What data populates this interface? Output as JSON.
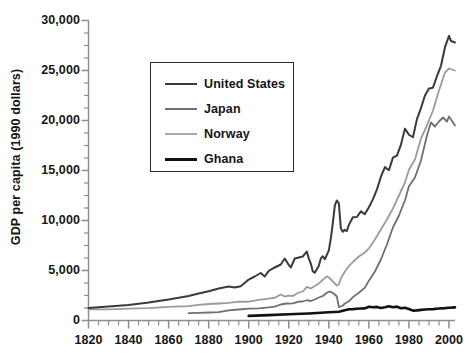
{
  "chart_data": {
    "type": "line",
    "title": "",
    "xlabel": "",
    "ylabel": "GDP per capita (1990 dollars)",
    "xlim": [
      1820,
      2003
    ],
    "ylim": [
      0,
      30000
    ],
    "grid": false,
    "legend_position": "upper-left-inside",
    "y_ticks": [
      0,
      5000,
      10000,
      15000,
      20000,
      25000,
      30000
    ],
    "y_tick_labels": [
      "0",
      "5,000",
      "10,000",
      "15,000",
      "20,000",
      "25,000",
      "30,000"
    ],
    "y_minor_step": 1250,
    "x_ticks": [
      1820,
      1840,
      1860,
      1880,
      1900,
      1920,
      1940,
      1960,
      1980,
      2000
    ],
    "x_tick_labels": [
      "1820",
      "1840",
      "1860",
      "1880",
      "1900",
      "1920",
      "1940",
      "1960",
      "1980",
      "2000"
    ],
    "x_minor_step": 5,
    "series": [
      {
        "name": "United States",
        "color": "#3a3a3a",
        "width": 2.0,
        "x": [
          1820,
          1830,
          1840,
          1850,
          1860,
          1870,
          1875,
          1880,
          1885,
          1890,
          1893,
          1896,
          1900,
          1903,
          1906,
          1908,
          1910,
          1913,
          1916,
          1918,
          1920,
          1921,
          1923,
          1925,
          1927,
          1929,
          1930,
          1931,
          1932,
          1933,
          1934,
          1935,
          1936,
          1937,
          1938,
          1939,
          1940,
          1941,
          1942,
          1943,
          1944,
          1945,
          1946,
          1947,
          1948,
          1949,
          1950,
          1952,
          1954,
          1956,
          1958,
          1960,
          1962,
          1964,
          1966,
          1968,
          1970,
          1972,
          1974,
          1976,
          1978,
          1980,
          1982,
          1984,
          1986,
          1988,
          1990,
          1992,
          1994,
          1996,
          1998,
          2000,
          2001,
          2003
        ],
        "y": [
          1257,
          1400,
          1560,
          1806,
          2102,
          2445,
          2700,
          2920,
          3200,
          3396,
          3300,
          3420,
          4091,
          4400,
          4750,
          4400,
          4964,
          5301,
          5600,
          6200,
          5552,
          5300,
          6200,
          6300,
          6400,
          6899,
          6213,
          5691,
          4908,
          4777,
          5114,
          5467,
          6204,
          6430,
          6126,
          6561,
          7010,
          8206,
          9741,
          11510,
          12000,
          11709,
          9197,
          8886,
          9065,
          8944,
          9561,
          10316,
          10350,
          10914,
          10640,
          11328,
          12110,
          13090,
          14379,
          15340,
          15030,
          16284,
          16491,
          17567,
          19188,
          18577,
          18325,
          20140,
          21236,
          22499,
          23201,
          23281,
          24427,
          25473,
          27331,
          28467,
          27948,
          27800
        ]
      },
      {
        "name": "Norway",
        "color": "#9b9b9b",
        "width": 1.8,
        "x": [
          1820,
          1830,
          1840,
          1850,
          1860,
          1870,
          1875,
          1880,
          1885,
          1890,
          1895,
          1900,
          1905,
          1910,
          1913,
          1916,
          1918,
          1920,
          1922,
          1925,
          1927,
          1929,
          1931,
          1933,
          1935,
          1937,
          1939,
          1940,
          1942,
          1944,
          1945,
          1946,
          1948,
          1950,
          1952,
          1955,
          1958,
          1960,
          1963,
          1966,
          1969,
          1972,
          1975,
          1978,
          1980,
          1983,
          1986,
          1989,
          1992,
          1995,
          1998,
          2000,
          2003
        ],
        "y": [
          1104,
          1120,
          1180,
          1245,
          1360,
          1432,
          1560,
          1650,
          1700,
          1762,
          1890,
          1877,
          2060,
          2190,
          2275,
          2600,
          2400,
          2480,
          2450,
          2800,
          2900,
          3370,
          3200,
          3450,
          3700,
          4060,
          4420,
          4300,
          3900,
          3500,
          3600,
          4200,
          4900,
          5430,
          5850,
          6400,
          6800,
          7204,
          8100,
          9100,
          10100,
          11200,
          12500,
          13800,
          15076,
          16100,
          18200,
          19500,
          21000,
          23000,
          24800,
          25200,
          25000
        ]
      },
      {
        "name": "Japan",
        "color": "#6f6f6f",
        "width": 1.8,
        "x": [
          1870,
          1875,
          1880,
          1885,
          1890,
          1895,
          1900,
          1905,
          1910,
          1913,
          1916,
          1919,
          1920,
          1922,
          1925,
          1927,
          1929,
          1931,
          1933,
          1935,
          1937,
          1939,
          1940,
          1941,
          1942,
          1943,
          1944,
          1945,
          1946,
          1947,
          1948,
          1950,
          1952,
          1955,
          1958,
          1960,
          1963,
          1966,
          1969,
          1972,
          1975,
          1978,
          1980,
          1983,
          1986,
          1989,
          1991,
          1993,
          1995,
          1997,
          1999,
          2000,
          2003
        ],
        "y": [
          737,
          760,
          800,
          840,
          1012,
          1100,
          1180,
          1220,
          1304,
          1387,
          1600,
          1700,
          1696,
          1720,
          1885,
          1900,
          2026,
          1950,
          2100,
          2300,
          2450,
          2770,
          2874,
          2870,
          2750,
          2600,
          2400,
          1346,
          1400,
          1500,
          1700,
          1921,
          2336,
          2771,
          3290,
          3986,
          4900,
          6100,
          7600,
          9300,
          10500,
          12000,
          13428,
          14300,
          16000,
          18500,
          19800,
          19400,
          19900,
          20300,
          19900,
          20400,
          19500
        ]
      },
      {
        "name": "Ghana",
        "color": "#111111",
        "width": 2.6,
        "x": [
          1900,
          1910,
          1920,
          1930,
          1940,
          1945,
          1950,
          1952,
          1954,
          1956,
          1958,
          1960,
          1962,
          1964,
          1966,
          1968,
          1970,
          1972,
          1974,
          1976,
          1978,
          1980,
          1982,
          1984,
          1986,
          1988,
          1990,
          1992,
          1995,
          1998,
          2000,
          2003
        ],
        "y": [
          462,
          540,
          620,
          700,
          820,
          870,
          1122,
          1140,
          1180,
          1200,
          1210,
          1378,
          1330,
          1360,
          1250,
          1330,
          1430,
          1330,
          1390,
          1220,
          1280,
          1157,
          990,
          1010,
          1060,
          1100,
          1120,
          1140,
          1200,
          1240,
          1280,
          1310
        ]
      }
    ]
  },
  "legend": {
    "items": [
      {
        "label": "United States",
        "color": "#3a3a3a",
        "thickness": 2.6
      },
      {
        "label": "Japan",
        "color": "#6f6f6f",
        "thickness": 2.6
      },
      {
        "label": "Norway",
        "color": "#a9a9a9",
        "thickness": 2.6
      },
      {
        "label": "Ghana",
        "color": "#111111",
        "thickness": 3.6
      }
    ]
  },
  "axis": {
    "line_color": "#8d8d8d",
    "tick_color": "#8d8d8d"
  }
}
